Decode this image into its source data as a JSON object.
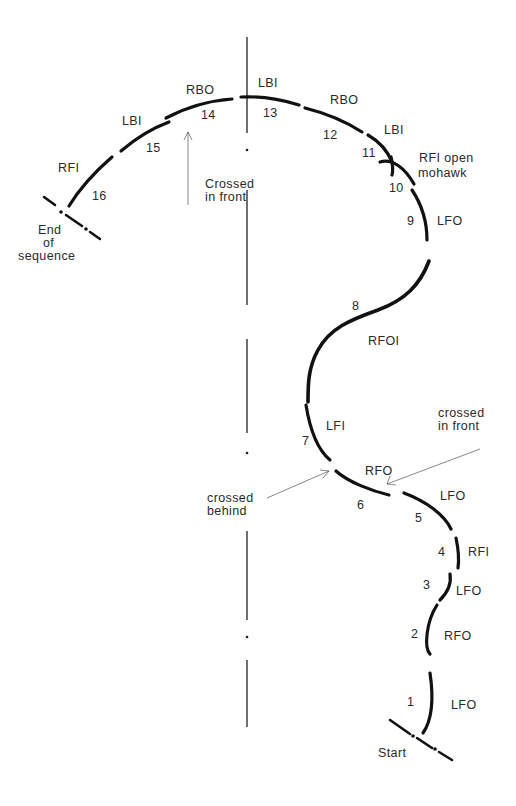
{
  "diagram": {
    "type": "skating-figure-tracing",
    "axis": {
      "orientation": "vertical",
      "style": "dash-dot"
    },
    "start_label": "Start",
    "end_label": [
      "End",
      "of",
      "sequence"
    ],
    "edges": [
      {
        "n": "1",
        "code": "LFO"
      },
      {
        "n": "2",
        "code": "RFO"
      },
      {
        "n": "3",
        "code": "LFO"
      },
      {
        "n": "4",
        "code": "RFI"
      },
      {
        "n": "5",
        "code": "LFO"
      },
      {
        "n": "6",
        "code": "RFO"
      },
      {
        "n": "7",
        "code": "LFI"
      },
      {
        "n": "8",
        "code": "RFOI"
      },
      {
        "n": "9",
        "code": "LFO"
      },
      {
        "n": "10",
        "code": "RFI open",
        "code2": "mohawk"
      },
      {
        "n": "11",
        "code": "LBI"
      },
      {
        "n": "12",
        "code": "RBO"
      },
      {
        "n": "13",
        "code": "LBI"
      },
      {
        "n": "14",
        "code": "RBO"
      },
      {
        "n": "15",
        "code": "LBI"
      },
      {
        "n": "16",
        "code": "RFI"
      }
    ],
    "annotations": {
      "crossed_in_front_top": [
        "Crossed",
        "in front"
      ],
      "crossed_in_front_right": [
        "crossed",
        "in front"
      ],
      "crossed_behind": [
        "crossed",
        "behind"
      ]
    }
  }
}
